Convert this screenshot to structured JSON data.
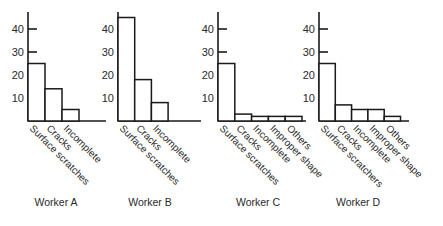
{
  "chart_data": [
    {
      "type": "bar",
      "title": "Worker A",
      "categories": [
        "Surface scratches",
        "Cracks",
        "Incomplete"
      ],
      "values": [
        25,
        14,
        5
      ],
      "xlabel": "",
      "ylabel": "",
      "yticks": [
        10,
        20,
        30,
        40
      ],
      "ylim": [
        0,
        45
      ],
      "grid": false
    },
    {
      "type": "bar",
      "title": "Worker B",
      "categories": [
        "Surface scratches",
        "Cracks",
        "Incomplete"
      ],
      "values": [
        45,
        18,
        8
      ],
      "xlabel": "",
      "ylabel": "",
      "yticks": [
        10,
        20,
        30,
        40
      ],
      "ylim": [
        0,
        45
      ],
      "grid": false
    },
    {
      "type": "bar",
      "title": "Worker C",
      "categories": [
        "Surface scratches",
        "Cracks",
        "Incomplete",
        "Improper shape",
        "Others"
      ],
      "values": [
        25,
        3,
        2,
        2,
        2
      ],
      "xlabel": "",
      "ylabel": "",
      "yticks": [
        10,
        20,
        30,
        40
      ],
      "ylim": [
        0,
        45
      ],
      "grid": false
    },
    {
      "type": "bar",
      "title": "Worker D",
      "categories": [
        "Surface scratchers",
        "Cracks",
        "Incomplete",
        "Improper shape",
        "Others"
      ],
      "values": [
        25,
        7,
        5,
        5,
        2
      ],
      "xlabel": "",
      "ylabel": "",
      "yticks": [
        10,
        20,
        30,
        40
      ],
      "ylim": [
        0,
        45
      ],
      "grid": false
    }
  ]
}
